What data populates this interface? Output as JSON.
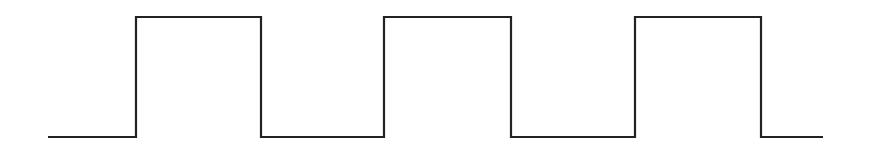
{
  "diagram": {
    "type": "square-wave",
    "stroke_color": "#222222",
    "background_color": "#ffffff",
    "stroke_width": 2.2,
    "levels": {
      "low_y": 137,
      "high_y": 17
    },
    "start_x": 48,
    "end_x": 823,
    "pulses": [
      {
        "rise_x": 136,
        "fall_x": 261
      },
      {
        "rise_x": 384,
        "fall_x": 511
      },
      {
        "rise_x": 635,
        "fall_x": 761
      }
    ],
    "pulse_count": 3,
    "labels": []
  }
}
